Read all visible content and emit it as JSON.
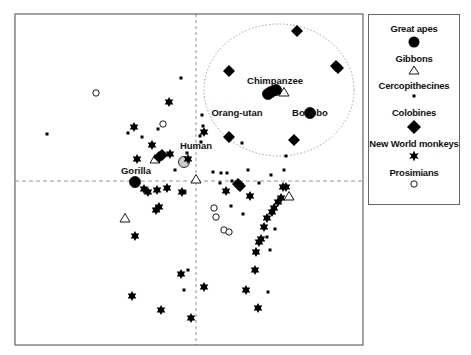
{
  "chart_data": {
    "type": "scatter",
    "title": "",
    "xlabel": "",
    "ylabel": "",
    "grid": false,
    "reference_lines": {
      "x": 0,
      "y": 0,
      "style": "dashed"
    },
    "xlim": [
      -18.1,
      16.7
    ],
    "ylim": [
      -16.4,
      16.7
    ],
    "legend_position": "right",
    "legend": [
      {
        "name": "Great apes",
        "marker": "filled-circle"
      },
      {
        "name": "Gibbons",
        "marker": "open-triangle"
      },
      {
        "name": "Cercopithecines",
        "marker": "small-square"
      },
      {
        "name": "Colobines",
        "marker": "filled-diamond"
      },
      {
        "name": "New World monkeys",
        "marker": "star"
      },
      {
        "name": "Prosimians",
        "marker": "open-circle"
      }
    ],
    "annotations": [
      {
        "text": "Chimpanzee",
        "x": 7.9,
        "y": 9.7
      },
      {
        "text": "Orang-utan",
        "x": 4.1,
        "y": 6.5
      },
      {
        "text": "Bonobo",
        "x": 11.4,
        "y": 6.5
      },
      {
        "text": "Human",
        "x": 0.0,
        "y": 3.2
      },
      {
        "text": "Gorilla",
        "x": -6.0,
        "y": 0.7
      },
      {
        "text": "",
        "shape": "dotted-ellipse",
        "cx": 8.3,
        "cy": 9.1,
        "rx": 7.5,
        "ry": 6.6
      }
    ],
    "series": [
      {
        "name": "Great apes",
        "points": [
          {
            "x": 8.0,
            "y": 9.1,
            "label": "Chimpanzee"
          },
          {
            "x": 7.2,
            "y": 8.7
          },
          {
            "x": 7.5,
            "y": 8.9,
            "label": "Orang-utan"
          },
          {
            "x": 11.4,
            "y": 6.8,
            "label": "Bonobo"
          },
          {
            "x": -1.2,
            "y": 1.9,
            "label": "Human",
            "fill": "#cccccc"
          },
          {
            "x": -6.1,
            "y": -0.1,
            "label": "Gorilla"
          }
        ]
      },
      {
        "name": "Gibbons",
        "points": [
          {
            "x": 8.8,
            "y": 8.9
          },
          {
            "x": 0.0,
            "y": 0.2
          },
          {
            "x": 9.3,
            "y": -1.5
          },
          {
            "x": -4.1,
            "y": 2.2
          },
          {
            "x": -7.1,
            "y": -3.7
          }
        ]
      },
      {
        "name": "Cercopithecines",
        "points": [
          {
            "x": -1.5,
            "y": 10.3
          },
          {
            "x": -14.9,
            "y": 4.7
          },
          {
            "x": -6.8,
            "y": 4.8
          },
          {
            "x": -5.9,
            "y": 2.1
          },
          {
            "x": -3.2,
            "y": 2.6
          },
          {
            "x": -0.9,
            "y": 2.8
          },
          {
            "x": -2.1,
            "y": 1.1
          },
          {
            "x": 0.5,
            "y": 3.9
          },
          {
            "x": 0.6,
            "y": 6.6
          },
          {
            "x": 0.7,
            "y": 5.5
          },
          {
            "x": 0.4,
            "y": 4.5
          },
          {
            "x": 2.5,
            "y": 0.8
          },
          {
            "x": 3.1,
            "y": 0.8
          },
          {
            "x": 1.7,
            "y": 0.9
          },
          {
            "x": 2.4,
            "y": -0.2
          },
          {
            "x": 4.6,
            "y": 3.8
          },
          {
            "x": 5.2,
            "y": 1.1
          },
          {
            "x": 6.3,
            "y": -0.2
          },
          {
            "x": 7.5,
            "y": 0.6
          },
          {
            "x": 8.8,
            "y": 1.1
          },
          {
            "x": 9.0,
            "y": 2.5
          },
          {
            "x": 3.6,
            "y": 0.0
          },
          {
            "x": -1.1,
            "y": -1.1
          },
          {
            "x": 4.7,
            "y": -3.3
          },
          {
            "x": 3.5,
            "y": -2.5
          },
          {
            "x": 7.9,
            "y": -4.8
          },
          {
            "x": 7.1,
            "y": -5.6
          },
          {
            "x": 7.4,
            "y": -6.9
          },
          {
            "x": 7.2,
            "y": -11.1
          },
          {
            "x": -0.8,
            "y": -8.9
          },
          {
            "x": -1.2,
            "y": -10.9
          },
          {
            "x": -3.8,
            "y": 5.2
          },
          {
            "x": -5.4,
            "y": 4.4
          }
        ]
      },
      {
        "name": "Colobines",
        "points": [
          {
            "x": 10.1,
            "y": 15.0
          },
          {
            "x": 3.3,
            "y": 11.0
          },
          {
            "x": 14.2,
            "y": 11.3
          },
          {
            "x": 14.0,
            "y": 11.5
          },
          {
            "x": 3.3,
            "y": 4.4
          },
          {
            "x": 9.8,
            "y": 4.1
          },
          {
            "x": -3.7,
            "y": 2.4
          },
          {
            "x": -3.4,
            "y": 2.6
          },
          {
            "x": 4.4,
            "y": -0.5
          },
          {
            "x": 4.2,
            "y": -0.3
          }
        ]
      },
      {
        "name": "New World monkeys",
        "points": [
          {
            "x": -2.7,
            "y": 7.9
          },
          {
            "x": -6.2,
            "y": 5.4
          },
          {
            "x": -2.6,
            "y": 2.7
          },
          {
            "x": 0.8,
            "y": 4.9
          },
          {
            "x": -5.9,
            "y": 2.2
          },
          {
            "x": -4.4,
            "y": 3.6
          },
          {
            "x": -5.2,
            "y": -0.8
          },
          {
            "x": -4.8,
            "y": -1.1
          },
          {
            "x": -3.9,
            "y": -0.9
          },
          {
            "x": -2.9,
            "y": -0.7
          },
          {
            "x": -3.7,
            "y": -2.6
          },
          {
            "x": -4.0,
            "y": -2.9
          },
          {
            "x": -6.1,
            "y": -5.5
          },
          {
            "x": -1.5,
            "y": -9.3
          },
          {
            "x": -6.4,
            "y": -11.5
          },
          {
            "x": -3.5,
            "y": -12.9
          },
          {
            "x": -1.4,
            "y": -1.1
          },
          {
            "x": 0.8,
            "y": -10.6
          },
          {
            "x": 3.0,
            "y": -1.0
          },
          {
            "x": 5.4,
            "y": -1.5
          },
          {
            "x": 8.7,
            "y": -0.6
          },
          {
            "x": 9.0,
            "y": -0.6
          },
          {
            "x": 8.5,
            "y": -1.7
          },
          {
            "x": 8.2,
            "y": -2.1
          },
          {
            "x": 7.8,
            "y": -2.7
          },
          {
            "x": 7.6,
            "y": -3.1
          },
          {
            "x": 7.1,
            "y": -3.7
          },
          {
            "x": 6.8,
            "y": -4.6
          },
          {
            "x": 6.5,
            "y": -5.8
          },
          {
            "x": 6.3,
            "y": -6.1
          },
          {
            "x": 6.0,
            "y": -7.1
          },
          {
            "x": 5.9,
            "y": -8.9
          },
          {
            "x": 6.2,
            "y": -12.7
          },
          {
            "x": 5.0,
            "y": -10.9
          },
          {
            "x": -0.5,
            "y": -13.7
          },
          {
            "x": -0.8,
            "y": 2.2
          }
        ]
      },
      {
        "name": "Prosimians",
        "points": [
          {
            "x": -10.0,
            "y": 8.8
          },
          {
            "x": -3.3,
            "y": 5.7
          },
          {
            "x": 1.8,
            "y": -2.7
          },
          {
            "x": 2.0,
            "y": -3.6
          },
          {
            "x": 2.8,
            "y": -4.9
          },
          {
            "x": 3.3,
            "y": -5.1
          }
        ]
      }
    ]
  },
  "legend": {
    "items": [
      {
        "label": "Great apes"
      },
      {
        "label": "Gibbons"
      },
      {
        "label": "Cercopithecines"
      },
      {
        "label": "Colobines"
      },
      {
        "label": "New World monkeys"
      },
      {
        "label": "Prosimians"
      }
    ]
  }
}
